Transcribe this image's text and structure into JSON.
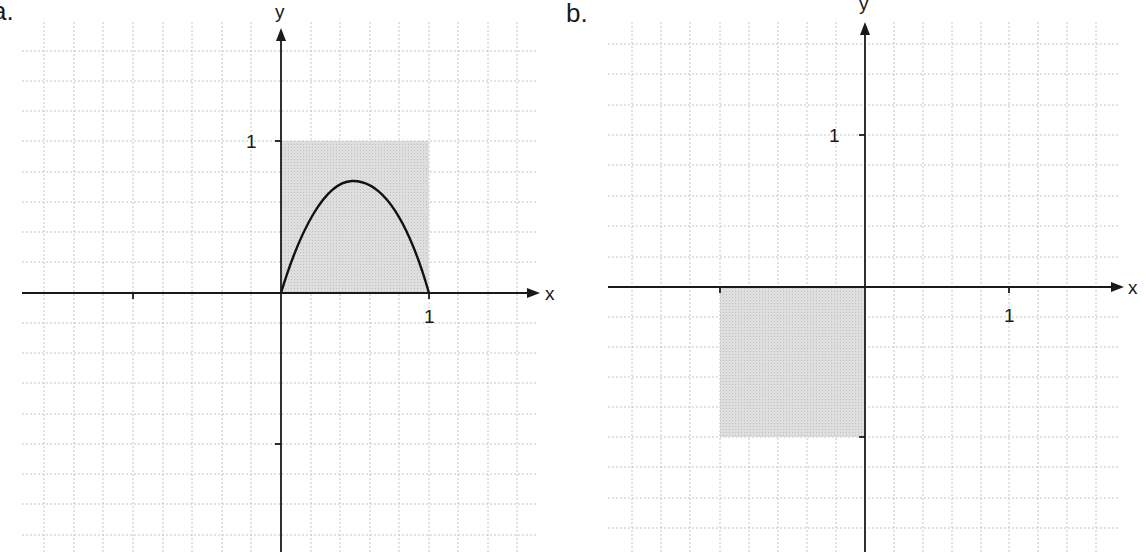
{
  "panels": [
    {
      "label": "a.",
      "x_axis_label": "x",
      "y_axis_label": "y",
      "x_tick_label": "1",
      "y_tick_label": "1",
      "shaded_region": {
        "x": [
          0,
          1
        ],
        "y": [
          0,
          1
        ],
        "color": "#d4d4d4"
      },
      "curve": {
        "description": "parabola-like arch from (0,0) peaking near (0.5, 0.73) back to (1,0)"
      }
    },
    {
      "label": "b.",
      "x_axis_label": "x",
      "y_axis_label": "y",
      "x_tick_label": "1",
      "y_tick_label": "1",
      "shaded_region": {
        "x": [
          -1,
          0
        ],
        "y": [
          -1,
          0
        ],
        "color": "#d4d4d4"
      }
    }
  ],
  "colors": {
    "axis": "#1a1a1a",
    "grid": "#b0b0b0",
    "shade": "#d4d4d4"
  }
}
